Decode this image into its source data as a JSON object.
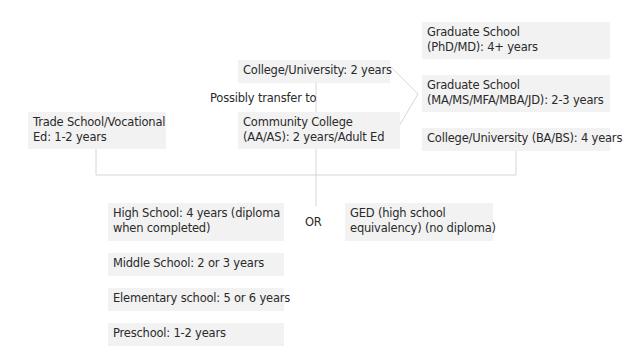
{
  "diagram": {
    "nodes": {
      "grad_phd": {
        "line1": "Graduate School",
        "line2": "(PhD/MD): 4+ years"
      },
      "grad_ma": {
        "line1": "Graduate School",
        "line2": "(MA/MS/MFA/MBA/JD): 2-3 years"
      },
      "college_ba": {
        "line1": "College/University (BA/BS): 4 years"
      },
      "college_2yr": {
        "line1": "College/University: 2 years"
      },
      "transfer_label": "Possibly transfer to",
      "community_college": {
        "line1": "Community College",
        "line2": "(AA/AS): 2 years/Adult Ed"
      },
      "trade_school": {
        "line1": "Trade School/Vocational",
        "line2": "Ed: 1-2 years"
      },
      "high_school": {
        "line1": "High School: 4 years (diploma",
        "line2": "when completed)"
      },
      "or_label": "OR",
      "ged": {
        "line1": "GED (high school",
        "line2": "equivalency) (no diploma)"
      },
      "middle_school": {
        "line1": "Middle School: 2 or 3 years"
      },
      "elementary_school": {
        "line1": "Elementary school: 5 or 6 years"
      },
      "preschool": {
        "line1": "Preschool: 1-2 years"
      }
    },
    "colors": {
      "box_fill": "#f2f2f2",
      "line": "#d6d6d6",
      "text": "#2a2a2a"
    }
  }
}
